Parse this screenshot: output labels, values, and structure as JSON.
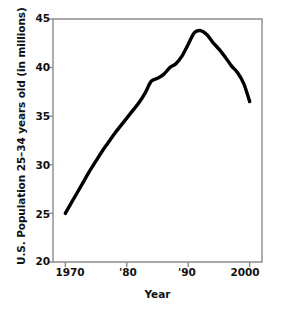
{
  "chart_data": {
    "type": "line",
    "title": "",
    "xlabel": "Year",
    "ylabel": "U.S. Population 25–34 years old (in millions)",
    "xlim": [
      1968,
      2002
    ],
    "ylim": [
      20,
      45
    ],
    "grid": false,
    "legend": "none",
    "line_color": "#000000",
    "frame_color": "#8c8c8c",
    "x_tick_labels": [
      "1970",
      "'80",
      "'90",
      "2000"
    ],
    "x_tick_values": [
      1970,
      1980,
      1990,
      2000
    ],
    "y_tick_labels": [
      "45",
      "40",
      "35",
      "30",
      "25",
      "20"
    ],
    "y_tick_values": [
      45,
      40,
      35,
      30,
      25,
      20
    ],
    "series": [
      {
        "name": "U.S. Population 25-34 years old",
        "x": [
          1970,
          1971,
          1972,
          1973,
          1974,
          1975,
          1976,
          1977,
          1978,
          1979,
          1980,
          1981,
          1982,
          1983,
          1984,
          1985,
          1986,
          1987,
          1988,
          1989,
          1990,
          1991,
          1992,
          1993,
          1994,
          1995,
          1996,
          1997,
          1998,
          1999,
          2000
        ],
        "values": [
          25.0,
          26.1,
          27.2,
          28.3,
          29.4,
          30.4,
          31.4,
          32.3,
          33.2,
          34.0,
          34.8,
          35.6,
          36.4,
          37.4,
          38.6,
          38.9,
          39.3,
          40.0,
          40.4,
          41.2,
          42.4,
          43.6,
          43.8,
          43.4,
          42.6,
          41.9,
          41.1,
          40.2,
          39.5,
          38.4,
          36.5
        ]
      }
    ]
  },
  "axes": {
    "x_ticks": [
      {
        "label": "1970",
        "value": 1970
      },
      {
        "label": "'80",
        "value": 1980
      },
      {
        "label": "'90",
        "value": 1990
      },
      {
        "label": "2000",
        "value": 2000
      }
    ],
    "y_ticks": [
      {
        "label": "45",
        "value": 45
      },
      {
        "label": "40",
        "value": 40
      },
      {
        "label": "35",
        "value": 35
      },
      {
        "label": "30",
        "value": 30
      },
      {
        "label": "25",
        "value": 25
      },
      {
        "label": "20",
        "value": 20
      }
    ]
  }
}
